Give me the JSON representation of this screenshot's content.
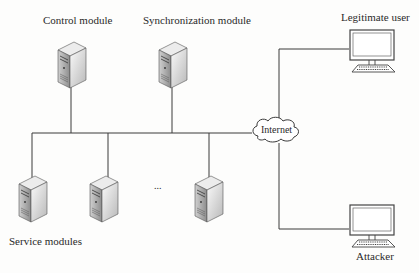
{
  "diagram": {
    "labels": {
      "control": "Control module",
      "sync": "Synchronization module",
      "service": "Service modules",
      "internet": "Internet",
      "legit": "Legitimate user",
      "attacker": "Attacker",
      "ellipsis": "..."
    },
    "colors": {
      "line": "#3a3a3a",
      "server_light": "#f2f2f2",
      "server_mid": "#c8c8c8",
      "server_dark": "#8a8a8a",
      "monitor_frame": "#444444",
      "text": "#2a2a2a"
    }
  }
}
